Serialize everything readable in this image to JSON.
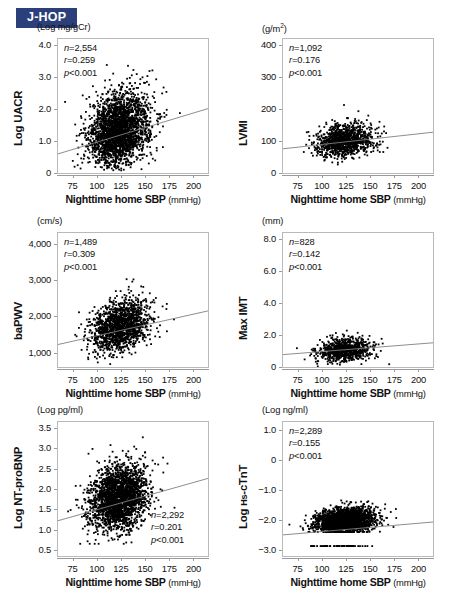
{
  "badge": {
    "label": "J-HOP",
    "color": "#2b3f7a",
    "text_color": "#ffffff"
  },
  "shared": {
    "xlabel_bold": "Nighttime home SBP",
    "xlabel_unit": "(mmHg)",
    "xticks": [
      "75",
      "100",
      "125",
      "150",
      "175",
      "200"
    ],
    "xlim": [
      60,
      215
    ],
    "point_color": "#000000",
    "fit_line_color": "#808080",
    "frame_color": "#b9b9b9"
  },
  "chart_data": [
    {
      "id": "uacr",
      "type": "scatter",
      "title": "",
      "ylabel": "Log UACR",
      "yunit": "(Log mg/gCr)",
      "xlabel": "Nighttime home SBP",
      "xunit": "(mmHg)",
      "n_label": "n=2,554",
      "r_label": "r=0.259",
      "p_label": "p<0.001",
      "n": 2554,
      "r": 0.259,
      "p": "<0.001",
      "xlim": [
        60,
        215
      ],
      "ylim": [
        0,
        4.2
      ],
      "yticks": [
        "0",
        "1.0",
        "2.0",
        "3.0",
        "4.0"
      ],
      "ytick_values": [
        0,
        1.0,
        2.0,
        3.0,
        4.0
      ],
      "xticks": [
        "75",
        "100",
        "125",
        "150",
        "175",
        "200"
      ],
      "xtick_values": [
        75,
        100,
        125,
        150,
        175,
        200
      ],
      "x_mean": 123,
      "x_sd": 15.5,
      "y_mean": 1.32,
      "y_sd": 0.52,
      "fit": {
        "x0": 60,
        "y0": 0.6,
        "x1": 215,
        "y1": 2.02
      },
      "stats_pos": "top-left",
      "grid": false,
      "legend": "none"
    },
    {
      "id": "lvmi",
      "type": "scatter",
      "ylabel": "LVMI",
      "yunit": "(g/m²)",
      "xlabel": "Nighttime home SBP",
      "xunit": "(mmHg)",
      "n_label": "n=1,092",
      "r_label": "r=0.176",
      "p_label": "p<0.001",
      "n": 1092,
      "r": 0.176,
      "p": "<0.001",
      "xlim": [
        60,
        215
      ],
      "ylim": [
        0,
        420
      ],
      "yticks": [
        "0",
        "100",
        "200",
        "300",
        "400"
      ],
      "ytick_values": [
        0,
        100,
        200,
        300,
        400
      ],
      "xticks": [
        "75",
        "100",
        "125",
        "150",
        "175",
        "200"
      ],
      "xtick_values": [
        75,
        100,
        125,
        150,
        175,
        200
      ],
      "x_mean": 124,
      "x_sd": 15.0,
      "y_mean": 99,
      "y_sd": 24,
      "fit": {
        "x0": 60,
        "y0": 76,
        "x1": 215,
        "y1": 128
      },
      "stats_pos": "top-left",
      "grid": false,
      "legend": "none"
    },
    {
      "id": "bapwv",
      "type": "scatter",
      "ylabel": "baPWV",
      "yunit": "(cm/s)",
      "xlabel": "Nighttime home SBP",
      "xunit": "(mmHg)",
      "n_label": "n=1,489",
      "r_label": "r=0.309",
      "p_label": "p<0.001",
      "n": 1489,
      "r": 0.309,
      "p": "<0.001",
      "xlim": [
        60,
        215
      ],
      "ylim": [
        600,
        4300
      ],
      "yticks": [
        "1,000",
        "2,000",
        "3,000",
        "4,000"
      ],
      "ytick_values": [
        1000,
        2000,
        3000,
        4000
      ],
      "xticks": [
        "75",
        "100",
        "125",
        "150",
        "175",
        "200"
      ],
      "xtick_values": [
        75,
        100,
        125,
        150,
        175,
        200
      ],
      "x_mean": 124,
      "x_sd": 15.0,
      "y_mean": 1700,
      "y_sd": 330,
      "fit": {
        "x0": 60,
        "y0": 1220,
        "x1": 215,
        "y1": 2150
      },
      "stats_pos": "top-left",
      "grid": false,
      "legend": "none"
    },
    {
      "id": "maximt",
      "type": "scatter",
      "ylabel": "Max IMT",
      "yunit": "(mm)",
      "xlabel": "Nighttime home SBP",
      "xunit": "(mmHg)",
      "n_label": "n=828",
      "r_label": "r=0.142",
      "p_label": "p<0.001",
      "n": 828,
      "r": 0.142,
      "p": "<0.001",
      "xlim": [
        60,
        215
      ],
      "ylim": [
        0,
        8.4
      ],
      "yticks": [
        "0",
        "2.0",
        "4.0",
        "6.0",
        "8.0"
      ],
      "ytick_values": [
        0,
        2.0,
        4.0,
        6.0,
        8.0
      ],
      "xticks": [
        "75",
        "100",
        "125",
        "150",
        "175",
        "200"
      ],
      "xtick_values": [
        75,
        100,
        125,
        150,
        175,
        200
      ],
      "x_mean": 124,
      "x_sd": 14.0,
      "y_mean": 1.05,
      "y_sd": 0.33,
      "fit": {
        "x0": 60,
        "y0": 0.78,
        "x1": 215,
        "y1": 1.52
      },
      "stats_pos": "top-left",
      "grid": false,
      "legend": "none"
    },
    {
      "id": "ntprobnp",
      "type": "scatter",
      "ylabel": "Log NT-proBNP",
      "yunit": "(Log pg/ml)",
      "xlabel": "Nighttime home SBP",
      "xunit": "(mmHg)",
      "n_label": "n=2,292",
      "r_label": "r=0.201",
      "p_label": "p<0.001",
      "n": 2292,
      "r": 0.201,
      "p": "<0.001",
      "xlim": [
        60,
        215
      ],
      "ylim": [
        0.35,
        3.65
      ],
      "yticks": [
        "0.5",
        "1.0",
        "1.5",
        "2.0",
        "2.5",
        "3.0",
        "3.5"
      ],
      "ytick_values": [
        0.5,
        1.0,
        1.5,
        2.0,
        2.5,
        3.0,
        3.5
      ],
      "xticks": [
        "75",
        "100",
        "125",
        "150",
        "175",
        "200"
      ],
      "xtick_values": [
        75,
        100,
        125,
        150,
        175,
        200
      ],
      "x_mean": 123,
      "x_sd": 15.0,
      "y_mean": 1.78,
      "y_sd": 0.4,
      "floor": 0.65,
      "fit": {
        "x0": 60,
        "y0": 1.22,
        "x1": 215,
        "y1": 2.26
      },
      "stats_pos": "bottom-right",
      "grid": false,
      "legend": "none"
    },
    {
      "id": "hscTnT",
      "type": "scatter",
      "ylabel": "Log Hs-cTnT",
      "yunit": "(Log ng/ml)",
      "xlabel": "Nighttime home SBP",
      "xunit": "(mmHg)",
      "n_label": "n=2,289",
      "r_label": "r=0.155",
      "p_label": "p<0.001",
      "n": 2289,
      "r": 0.155,
      "p": "<0.001",
      "xlim": [
        60,
        215
      ],
      "ylim": [
        -3.2,
        1.25
      ],
      "yticks": [
        "1.0",
        "0",
        "−1.0",
        "−2.0",
        "−3.0"
      ],
      "ytick_values": [
        1.0,
        0,
        -1.0,
        -2.0,
        -3.0
      ],
      "xticks": [
        "75",
        "100",
        "125",
        "150",
        "175",
        "200"
      ],
      "xtick_values": [
        75,
        100,
        125,
        150,
        175,
        200
      ],
      "x_mean": 124,
      "x_sd": 15.0,
      "y_mean": -2.05,
      "y_sd": 0.22,
      "floor": -2.4,
      "floor2": -2.87,
      "fit": {
        "x0": 60,
        "y0": -2.5,
        "x1": 215,
        "y1": -2.07
      },
      "stats_pos": "top-left",
      "grid": false,
      "legend": "none"
    }
  ],
  "panels": [
    {
      "id": "uacr",
      "left": 0,
      "top": 22,
      "col": 0,
      "row": 0
    },
    {
      "id": "lvmi",
      "left": 225,
      "top": 22,
      "col": 1,
      "row": 0
    },
    {
      "id": "bapwv",
      "left": 0,
      "top": 216,
      "col": 0,
      "row": 1
    },
    {
      "id": "maximt",
      "left": 225,
      "top": 216,
      "col": 1,
      "row": 1
    },
    {
      "id": "ntprobnp",
      "left": 0,
      "top": 405,
      "col": 0,
      "row": 2
    },
    {
      "id": "hscTnT",
      "left": 225,
      "top": 405,
      "col": 1,
      "row": 2
    }
  ]
}
